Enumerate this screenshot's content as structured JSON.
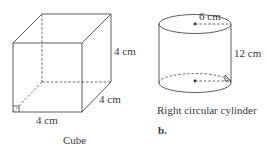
{
  "figures": [
    {
      "id": "cube",
      "caption": "Cube",
      "labels": {
        "height": "4 cm",
        "depth": "4 cm",
        "width": "4 cm"
      },
      "edge_length_cm": 4
    },
    {
      "id": "cylinder",
      "caption": "Right circular cylinder",
      "part_label": "b.",
      "labels": {
        "radius": "6 cm",
        "height": "12 cm"
      },
      "radius_cm": 6,
      "height_cm": 12
    }
  ],
  "colors": {
    "line": "#4a4a4a",
    "text": "#3a3a3a",
    "background": "#ffffff"
  }
}
